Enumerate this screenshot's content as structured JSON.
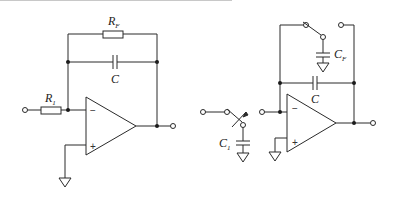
{
  "diagrams": [
    {
      "name": "integrator-with-rf",
      "labels": {
        "rf_main": "R",
        "rf_sub": "F",
        "c": "C",
        "r1_main": "R",
        "r1_sub": "1",
        "minus": "−",
        "plus": "+"
      }
    },
    {
      "name": "switched-capacitor-integrator",
      "labels": {
        "cf_main": "C",
        "cf_sub": "F",
        "c": "C",
        "c1_main": "C",
        "c1_sub": "1",
        "minus": "−",
        "plus": "+"
      }
    }
  ],
  "colors": {
    "line": "#2a2a2a",
    "background": "#ffffff",
    "top_rule": "#c8c8c8"
  }
}
